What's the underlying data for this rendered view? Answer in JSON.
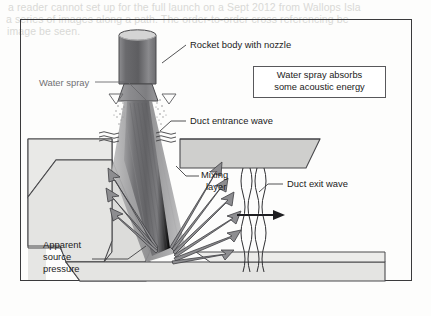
{
  "page": {
    "bleed_text": [
      "a reader cannot set up for the full launch on a Sept 2012 from Wallops Isla",
      "a series of images along a path. The order-to-order cross referencing be",
      "image be seen."
    ]
  },
  "figure": {
    "title_box": {
      "line1": "Water spray absorbs",
      "line2": "some acoustic energy"
    },
    "labels": {
      "rocket_body": "Rocket body with nozzle",
      "water_spray": "Water spray",
      "duct_entrance_wave": "Duct entrance wave",
      "mixing_layer_line1": "Mixing",
      "mixing_layer_line2": "layer",
      "duct_exit_wave": "Duct exit wave",
      "apparent_source_line1": "Apparent",
      "apparent_source_line2": "source",
      "apparent_source_line3": "pressure"
    },
    "colors": {
      "frame": "#3a3a3c",
      "outline": "#4a4a4d",
      "wall_fill": "#e3e3e1",
      "slab_fill": "#cfcfcd",
      "plume_dark": "#6e6e70",
      "plume_mid": "#8f8f91",
      "plume_light": "#b5b5b6",
      "rocket_dark": "#5d5d60",
      "rocket_light": "#a8a8aa",
      "arrow_fill": "#8d8d90",
      "text": "#1b1b1b",
      "text_gray": "#707073",
      "background": "#fdfdfc"
    },
    "shapes": {
      "arrow_count": 9,
      "spray_nozzle_count": 2,
      "entrance_wave_line_count": 3,
      "exit_wave_line_count": 4
    }
  }
}
